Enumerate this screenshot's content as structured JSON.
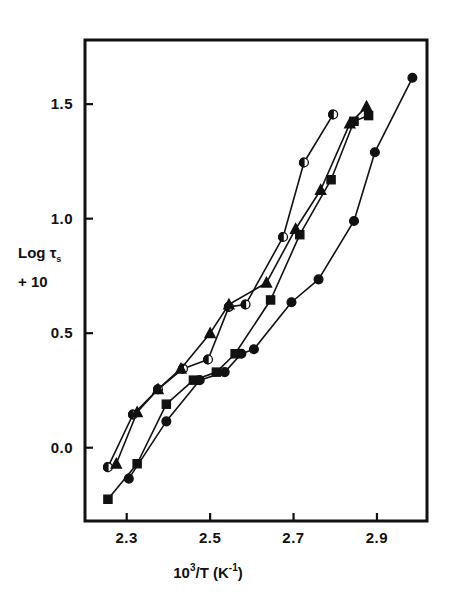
{
  "chart_data": {
    "type": "line",
    "title": "",
    "xlabel": "10^3/T (K^-1)",
    "ylabel": "Log tau_s + 10",
    "xlabel_parts": {
      "base": "10",
      "exp": "3",
      "mid": "/T (K",
      "sup2": "-1",
      "close": ")"
    },
    "ylabel_line1_pre": "Log ",
    "ylabel_line1_sym": "τ",
    "ylabel_line1_sub": "s",
    "ylabel_line2": "+ 10",
    "xlim": [
      2.2,
      3.02
    ],
    "ylim": [
      -0.32,
      1.78
    ],
    "xticks": [
      2.3,
      2.5,
      2.7,
      2.9
    ],
    "xticklabels": [
      "2.3",
      "2.5",
      "2.7",
      "2.9"
    ],
    "yticks": [
      0.0,
      0.5,
      1.0,
      1.5
    ],
    "yticklabels": [
      "0.0",
      "0.5",
      "1.0",
      "1.5"
    ],
    "grid": false,
    "legend": "none",
    "line_color": "#111111",
    "series": [
      {
        "name": "half-filled-circle",
        "marker": "half-circle",
        "x": [
          2.255,
          2.315,
          2.375,
          2.435,
          2.495,
          2.545,
          2.585,
          2.675,
          2.725,
          2.795
        ],
        "y": [
          -0.085,
          0.145,
          0.255,
          0.345,
          0.385,
          0.615,
          0.625,
          0.92,
          1.245,
          1.455
        ]
      },
      {
        "name": "filled-triangle",
        "marker": "triangle",
        "x": [
          2.275,
          2.325,
          2.375,
          2.43,
          2.5,
          2.545,
          2.635,
          2.705,
          2.765,
          2.835,
          2.875
        ],
        "y": [
          -0.07,
          0.155,
          0.255,
          0.345,
          0.5,
          0.625,
          0.72,
          0.955,
          1.125,
          1.415,
          1.49
        ]
      },
      {
        "name": "filled-square",
        "marker": "square",
        "x": [
          2.255,
          2.325,
          2.395,
          2.46,
          2.515,
          2.56,
          2.645,
          2.715,
          2.79,
          2.845,
          2.88
        ],
        "y": [
          -0.225,
          -0.07,
          0.19,
          0.295,
          0.33,
          0.41,
          0.645,
          0.93,
          1.17,
          1.425,
          1.45
        ]
      },
      {
        "name": "filled-circle",
        "marker": "circle",
        "x": [
          2.305,
          2.395,
          2.475,
          2.535,
          2.575,
          2.605,
          2.695,
          2.76,
          2.845,
          2.895,
          2.985
        ],
        "y": [
          -0.135,
          0.115,
          0.295,
          0.33,
          0.41,
          0.43,
          0.635,
          0.735,
          0.99,
          1.29,
          1.615
        ]
      }
    ]
  },
  "plot_frame": {
    "left_px": 85,
    "right_px": 427,
    "top_px": 40,
    "bottom_px": 521
  }
}
